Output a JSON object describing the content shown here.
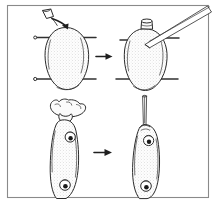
{
  "figure": {
    "kind": "line-drawing",
    "panel_count": 4,
    "canvas": {
      "width": 216,
      "height": 203
    },
    "colors": {
      "background": "#ffffff",
      "ink": "#2b2b2b",
      "frame": "#8a8a8a",
      "stipple": "#9a9a9a",
      "pupil": "#1a1a1a",
      "arrow": "#1f1f1f"
    },
    "frame": {
      "label": "figure-border",
      "stroke": "#8a8a8a"
    },
    "panels": [
      {
        "id": "panel-top-left",
        "position": "top-left",
        "caption": "",
        "subject": "egg-with-pins",
        "elements": [
          {
            "name": "egg-outline",
            "label": ""
          },
          {
            "name": "pin-upper-left",
            "label": ""
          },
          {
            "name": "pin-upper-right",
            "label": ""
          },
          {
            "name": "pin-lower-left",
            "label": ""
          },
          {
            "name": "pin-lower-right",
            "label": ""
          },
          {
            "name": "dropper-cup",
            "label": ""
          },
          {
            "name": "curved-arrow",
            "label": ""
          }
        ]
      },
      {
        "id": "panel-top-right",
        "position": "top-right",
        "caption": "",
        "subject": "egg-with-collar-and-pipette",
        "elements": [
          {
            "name": "egg-outline",
            "label": ""
          },
          {
            "name": "collar-cap",
            "label": ""
          },
          {
            "name": "injection-pipette",
            "label": ""
          },
          {
            "name": "pin-upper-left",
            "label": ""
          },
          {
            "name": "pin-upper-right",
            "label": ""
          },
          {
            "name": "pin-lower-left",
            "label": ""
          },
          {
            "name": "pin-lower-right",
            "label": ""
          }
        ]
      },
      {
        "id": "panel-bottom-left",
        "position": "bottom-left",
        "caption": "",
        "subject": "larva-with-yolk-mass",
        "elements": [
          {
            "name": "larva-body",
            "label": ""
          },
          {
            "name": "yolk-mass",
            "label": ""
          },
          {
            "name": "eye-spot-upper",
            "label": ""
          },
          {
            "name": "eye-spot-lower",
            "label": ""
          }
        ]
      },
      {
        "id": "panel-bottom-right",
        "position": "bottom-right",
        "caption": "",
        "subject": "larva-with-capillary",
        "elements": [
          {
            "name": "larva-body",
            "label": ""
          },
          {
            "name": "capillary-tube",
            "label": ""
          },
          {
            "name": "eye-spot-upper",
            "label": ""
          },
          {
            "name": "eye-spot-lower",
            "label": ""
          }
        ]
      }
    ],
    "arrows": [
      {
        "name": "transition-arrow-top",
        "direction": "right",
        "from": "panel-top-left",
        "to": "panel-top-right"
      },
      {
        "name": "transition-arrow-bottom",
        "direction": "right",
        "from": "panel-bottom-left",
        "to": "panel-bottom-right"
      }
    ],
    "alt_text": "Four-panel black and white scientific line drawing. Top left: an oval egg held by four pins with a small cup and curved arrow above it. Top right: the same egg now with a small collar at the top and a slender pipette inserted diagonally. Bottom left: an elongated larva with two dark eye spots and an irregular yolk mass at its head. Bottom right: the same larva with a thin vertical capillary tube inserted into its head."
  }
}
